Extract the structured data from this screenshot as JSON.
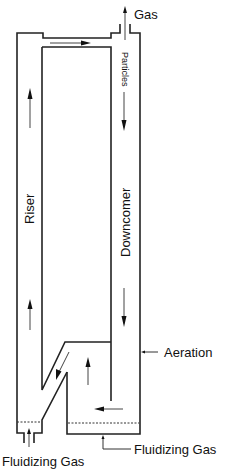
{
  "diagram": {
    "labels": {
      "gas_outlet": "Gas",
      "particles": "Particles",
      "riser": "Riser",
      "downcomer": "Downcomer",
      "aeration": "Aeration",
      "fluidizing_gas_left": "Fluidizing Gas",
      "fluidizing_gas_right": "Fluidizing Gas"
    },
    "flow_arrows": [
      {
        "name": "top-connector-flow",
        "direction": "right"
      },
      {
        "name": "riser-upper-flow",
        "direction": "up"
      },
      {
        "name": "riser-lower-flow",
        "direction": "up"
      },
      {
        "name": "downcomer-upper-flow",
        "direction": "down"
      },
      {
        "name": "downcomer-lower-flow",
        "direction": "down"
      },
      {
        "name": "loop-seal-diagonal-flow",
        "direction": "down-left"
      },
      {
        "name": "loop-seal-upflow",
        "direction": "up"
      },
      {
        "name": "loop-seal-bottom-flow",
        "direction": "left"
      },
      {
        "name": "gas-outlet-flow",
        "direction": "up"
      },
      {
        "name": "fluidizing-gas-inlet-flow",
        "direction": "up"
      }
    ],
    "colors": {
      "line": "#222222",
      "background": "#ffffff"
    }
  }
}
